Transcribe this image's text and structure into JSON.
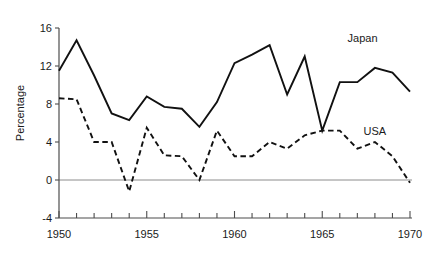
{
  "chart_data": {
    "type": "line",
    "title": "",
    "xlabel": "",
    "ylabel": "Percentage",
    "xlim": [
      1950,
      1970
    ],
    "ylim": [
      -4,
      16
    ],
    "grid": false,
    "legend_position": "inline-right",
    "x": [
      1950,
      1951,
      1952,
      1953,
      1954,
      1955,
      1956,
      1957,
      1958,
      1959,
      1960,
      1961,
      1962,
      1963,
      1964,
      1965,
      1966,
      1967,
      1968,
      1969,
      1970
    ],
    "xticks": [
      1950,
      1955,
      1960,
      1965,
      1970
    ],
    "xtick_labels": [
      "1950",
      "1955",
      "1960",
      "1965",
      "1970"
    ],
    "xminor_ticks": [
      1951,
      1952,
      1953,
      1954,
      1956,
      1957,
      1958,
      1959,
      1961,
      1962,
      1963,
      1964,
      1966,
      1967,
      1968,
      1969
    ],
    "yticks": [
      -4,
      0,
      4,
      8,
      12,
      16
    ],
    "ytick_labels": [
      "-4",
      "0",
      "4",
      "8",
      "12",
      "16"
    ],
    "zero_reference_line": 0,
    "series": [
      {
        "name": "Japan",
        "style": "solid",
        "color": "#111111",
        "label_position": {
          "x": 1967.3,
          "y": 15.0
        },
        "values": [
          11.5,
          14.7,
          11.0,
          7.0,
          6.3,
          8.8,
          7.7,
          7.5,
          5.6,
          8.2,
          12.3,
          13.2,
          14.2,
          9.0,
          13.0,
          5.2,
          10.3,
          10.3,
          11.8,
          11.3,
          9.3
        ]
      },
      {
        "name": "USA",
        "style": "dashed",
        "color": "#111111",
        "label_position": {
          "x": 1968.0,
          "y": 5.2
        },
        "values": [
          8.6,
          8.5,
          4.0,
          4.0,
          -1.2,
          5.5,
          2.6,
          2.5,
          0.0,
          5.2,
          2.5,
          2.5,
          4.0,
          3.3,
          4.7,
          5.2,
          5.2,
          3.3,
          4.0,
          2.5,
          -0.3
        ]
      }
    ]
  },
  "axis": {
    "y_title": "Percentage"
  },
  "labels": {
    "japan": "Japan",
    "usa": "USA"
  }
}
